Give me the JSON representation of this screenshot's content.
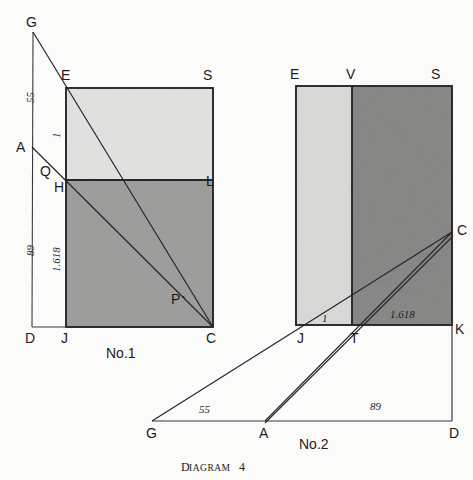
{
  "caption": {
    "prefix": "D",
    "word": "IAGRAM",
    "number": "4",
    "full": "Diagram 4"
  },
  "colors": {
    "paper": "#fbfbfa",
    "ink": "#262626",
    "light_gray": "#e2e2e0",
    "mid_gray": "#9b9b99",
    "dark_gray": "#848482"
  },
  "figures": [
    {
      "id": "no-1",
      "number_label": "No.1",
      "number_pos": {
        "x": 107,
        "y": 356
      },
      "rect": {
        "x": 66,
        "y": 88,
        "w": 147,
        "h": 239
      },
      "divider_y": 180,
      "upper_fill": "#e2e2e0",
      "lower_fill": "#9b9b99",
      "vertices": [
        {
          "name": "G",
          "label": "G",
          "px": 33,
          "py": 32,
          "lx": 26,
          "ly": 27
        },
        {
          "name": "E",
          "label": "E",
          "px": 66,
          "py": 88,
          "lx": 61,
          "ly": 80
        },
        {
          "name": "S",
          "label": "S",
          "px": 213,
          "py": 88,
          "lx": 203,
          "ly": 80
        },
        {
          "name": "A",
          "label": "A",
          "px": 32,
          "py": 147,
          "lx": 18,
          "ly": 152
        },
        {
          "name": "Q",
          "label": "Q",
          "px": 50,
          "py": 166,
          "lx": 41,
          "ly": 175
        },
        {
          "name": "H",
          "label": "H",
          "px": 66,
          "py": 180,
          "lx": 56,
          "ly": 192
        },
        {
          "name": "L",
          "label": "L",
          "px": 213,
          "py": 180,
          "lx": 205,
          "ly": 185
        },
        {
          "name": "D",
          "label": "D",
          "px": 32,
          "py": 327,
          "lx": 25,
          "ly": 342
        },
        {
          "name": "J",
          "label": "J",
          "px": 66,
          "py": 327,
          "lx": 61,
          "ly": 342
        },
        {
          "name": "C",
          "label": "C",
          "px": 213,
          "py": 327,
          "lx": 207,
          "ly": 342
        },
        {
          "name": "P",
          "label": "P",
          "px": 186,
          "py": 295,
          "lx": 172,
          "ly": 303
        }
      ],
      "measures": [
        {
          "value": "55",
          "x": 34,
          "y": 103,
          "rotated": true
        },
        {
          "value": "1",
          "x": 59,
          "y": 138,
          "rotated": true
        },
        {
          "value": "89",
          "x": 34,
          "y": 252,
          "rotated": true
        },
        {
          "value": "1.618",
          "x": 59,
          "y": 262,
          "rotated": true
        }
      ]
    },
    {
      "id": "no-2",
      "number_label": "No.2",
      "number_pos": {
        "x": 300,
        "y": 447
      },
      "rect": {
        "x": 296,
        "y": 86,
        "w": 156,
        "h": 239
      },
      "divider_x": 352,
      "left_fill": "#d7d7d5",
      "right_fill": "#848482",
      "vertices": [
        {
          "name": "E",
          "label": "E",
          "px": 296,
          "py": 86,
          "lx": 290,
          "ly": 79
        },
        {
          "name": "V",
          "label": "V",
          "px": 352,
          "py": 86,
          "lx": 346,
          "ly": 79
        },
        {
          "name": "S",
          "label": "S",
          "px": 452,
          "py": 86,
          "lx": 431,
          "ly": 79
        },
        {
          "name": "C",
          "label": "C",
          "px": 452,
          "py": 232,
          "lx": 457,
          "ly": 233
        },
        {
          "name": "J",
          "label": "J",
          "px": 296,
          "py": 325,
          "lx": 297,
          "ly": 342
        },
        {
          "name": "T",
          "label": "T",
          "px": 352,
          "py": 325,
          "lx": 350,
          "ly": 342
        },
        {
          "name": "K",
          "label": "K",
          "px": 452,
          "py": 325,
          "lx": 453,
          "ly": 333
        },
        {
          "name": "G",
          "label": "G",
          "px": 152,
          "py": 421,
          "lx": 147,
          "ly": 437
        },
        {
          "name": "A",
          "label": "A",
          "px": 265,
          "py": 421,
          "lx": 260,
          "ly": 437
        },
        {
          "name": "D",
          "label": "D",
          "px": 452,
          "py": 421,
          "lx": 450,
          "ly": 437
        }
      ],
      "measures": [
        {
          "value": "1",
          "x": 325,
          "y": 319,
          "rotated": false
        },
        {
          "value": "1.618",
          "x": 392,
          "y": 315,
          "rotated": false
        },
        {
          "value": "55",
          "x": 202,
          "y": 413,
          "rotated": false
        },
        {
          "value": "89",
          "x": 372,
          "y": 409,
          "rotated": false
        }
      ]
    }
  ]
}
